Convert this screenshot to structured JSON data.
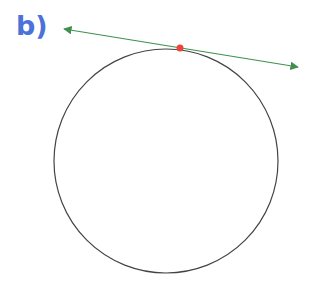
{
  "label": {
    "text": "b)",
    "color": "#4a72d8"
  },
  "circle": {
    "cx": 166,
    "cy": 161,
    "r": 111,
    "stroke": "#444444"
  },
  "tangent_line": {
    "x1": 64,
    "y1": 29,
    "x2": 298,
    "y2": 67,
    "color": "#3f8f4f"
  },
  "tangent_point": {
    "cx": 180,
    "cy": 48,
    "r": 3.5,
    "color": "#e8453c"
  }
}
